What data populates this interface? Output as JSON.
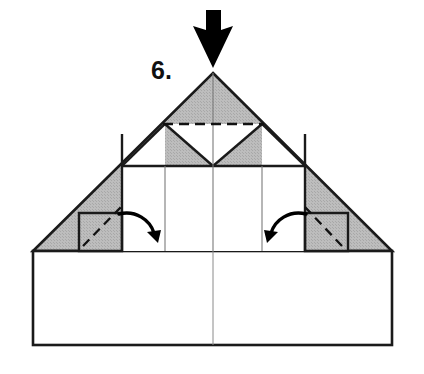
{
  "diagram": {
    "step_label": "6.",
    "canvas": {
      "width": 424,
      "height": 374,
      "background": "#ffffff"
    },
    "colors": {
      "paper_front": "#ffffff",
      "paper_back_shaded": "#b8b8b8",
      "outline": "#1a1a1a",
      "crease_thin": "#4d4d4d",
      "fold_dashed": "#111111",
      "arrow_fill": "#000000"
    },
    "shapes": {
      "base_rectangle": {
        "name": "bottom-base-rectangle",
        "left": 33,
        "right": 392,
        "top": 251,
        "bottom": 345,
        "fill": "#ffffff",
        "center_crease_x": 213
      },
      "big_triangle": {
        "name": "upper-shaded-triangle",
        "apex_x": 213,
        "apex_y": 73,
        "left_x": 33,
        "right_x": 392,
        "base_y": 251,
        "fill": "#b8b8b8"
      },
      "inner_white_panel": {
        "name": "inner-white-panel",
        "left": 122,
        "right": 305,
        "top": 166,
        "bottom": 251,
        "fill": "#ffffff"
      },
      "left_flap": {
        "name": "left-shaded-flap",
        "left": 79,
        "right": 122,
        "top": 213,
        "bottom": 251,
        "fill": "#b8b8b8"
      },
      "right_flap": {
        "name": "right-shaded-flap",
        "left": 305,
        "right": 348,
        "top": 213,
        "bottom": 251,
        "fill": "#b8b8b8"
      },
      "center_v_notch": {
        "name": "center-v-white-notch",
        "left_x": 165,
        "right_x": 262,
        "top_y": 124,
        "vertex_x": 213,
        "vertex_y": 166,
        "fill": "#ffffff"
      }
    },
    "creases": {
      "vertical_thick": [
        122,
        305
      ],
      "vertical_thin": [
        165,
        213,
        262
      ],
      "horizontal_solid_y": 166,
      "dashed_valley_line": {
        "name": "top-valley-fold-dashed",
        "x1": 165,
        "y1": 124,
        "x2": 262,
        "y2": 124,
        "dash": "9,6"
      },
      "left_flap_fold": {
        "name": "left-flap-fold-dashed",
        "x1": 84,
        "y1": 245,
        "x2": 120,
        "y2": 208
      },
      "right_flap_fold": {
        "name": "right-flap-fold-dashed",
        "x1": 341,
        "y1": 245,
        "x2": 306,
        "y2": 208
      }
    },
    "arrows": {
      "push_arrow": {
        "name": "push-down-arrow",
        "type": "push",
        "direction": "down",
        "tip_x": 213,
        "tip_y": 68,
        "shaft_top_y": 10,
        "fill": "#000000"
      },
      "left_curved_arrow": {
        "name": "left-fold-curved-arrow",
        "type": "fold-over",
        "direction": "right-down",
        "start_x": 122,
        "start_y": 215,
        "end_x": 152,
        "end_y": 240
      },
      "right_curved_arrow": {
        "name": "right-fold-curved-arrow",
        "type": "fold-over",
        "direction": "left-down",
        "start_x": 303,
        "start_y": 215,
        "end_x": 273,
        "end_y": 240
      }
    },
    "step_number_position": {
      "x": 151,
      "y": 79
    }
  }
}
